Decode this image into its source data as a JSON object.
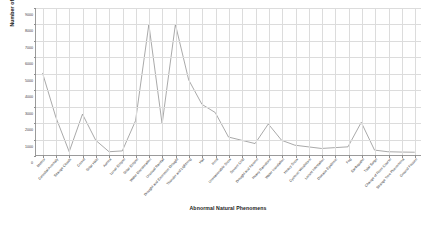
{
  "chart_data": {
    "type": "line",
    "title": "",
    "xlabel": "Abnormal Natural Phenomens",
    "ylabel": "Number of Occurrences",
    "ylim": [
      0,
      9000
    ],
    "yticks": [
      0,
      1000,
      2000,
      3000,
      4000,
      5000,
      6000,
      7000,
      8000,
      9000
    ],
    "ytick_labels": [
      "0",
      "1000",
      "2000",
      "3000",
      "4000",
      "5000",
      "6000",
      "7000",
      "8000",
      "9000"
    ],
    "grid": true,
    "legend": "none",
    "line_color": "#8c8c8c",
    "grid_color": "#dcdcdc",
    "axis_color": "#9a9a9a",
    "categories": [
      "Meteor",
      "Celestial Anomaly",
      "Strange Clouds",
      "Comet",
      "Solar Halo",
      "Aurora",
      "Lunar Eclipse",
      "Solar Eclipse",
      "Water Discoloration",
      "Unusual Rainfall",
      "Drought and Excessive Drought",
      "Thunder and Lightning",
      "Hail",
      "Frost",
      "Unseasonable Snow",
      "Severe Cold",
      "Drought and Famine",
      "Heavy Rainstorm",
      "Water Inundation",
      "Heavy Snow",
      "Cyclonic Windstorm",
      "Locust Infestation",
      "Disease Epidemic",
      "Fog",
      "Earthquake",
      "Tidal Surge",
      "Change of River Course",
      "Strange Tree Phenomena",
      "Ground Fissure"
    ],
    "values": [
      5000,
      2300,
      200,
      2500,
      900,
      200,
      250,
      2100,
      8000,
      1900,
      8000,
      4600,
      3100,
      2600,
      1100,
      900,
      700,
      1900,
      900,
      600,
      500,
      400,
      450,
      500,
      2000,
      300,
      200,
      180,
      170
    ]
  }
}
